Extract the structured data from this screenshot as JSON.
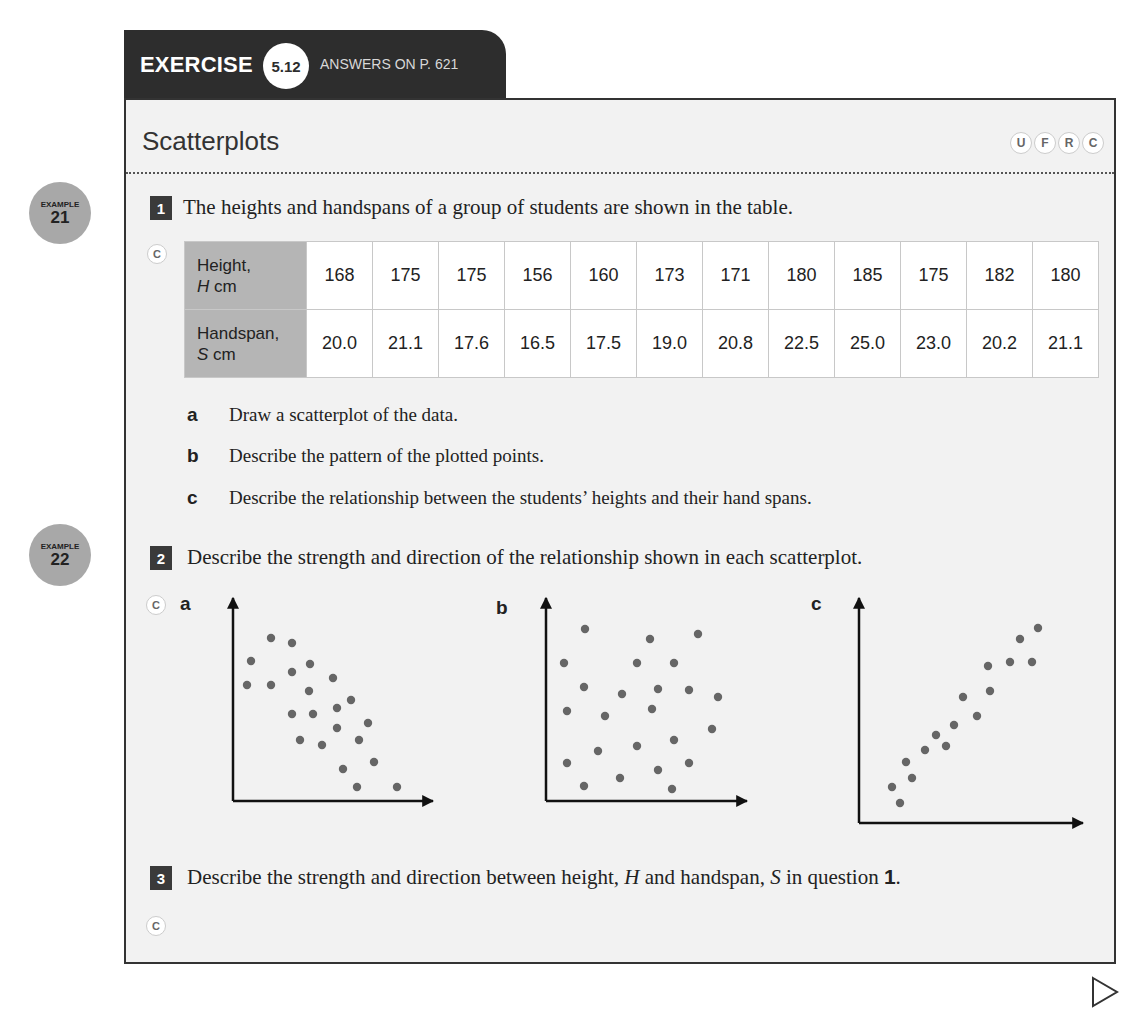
{
  "header": {
    "exercise_label": "EXERCISE",
    "exercise_number": "5.12",
    "answers_ref": "ANSWERS ON P. 621"
  },
  "section": {
    "title": "Scatterplots",
    "skill_badges": [
      "U",
      "F",
      "R",
      "C"
    ]
  },
  "examples": [
    {
      "label": "EXAMPLE",
      "number": "21"
    },
    {
      "label": "EXAMPLE",
      "number": "22"
    }
  ],
  "questions": [
    {
      "number": "1",
      "text": "The heights and handspans of a group of students are shown in the table.",
      "badge": "C",
      "table": {
        "rows": [
          {
            "header_line1": "Height,",
            "header_var": "H",
            "header_unit": " cm",
            "values": [
              "168",
              "175",
              "175",
              "156",
              "160",
              "173",
              "171",
              "180",
              "185",
              "175",
              "182",
              "180"
            ]
          },
          {
            "header_line1": "Handspan,",
            "header_var": "S",
            "header_unit": " cm",
            "values": [
              "20.0",
              "21.1",
              "17.6",
              "16.5",
              "17.5",
              "19.0",
              "20.8",
              "22.5",
              "25.0",
              "23.0",
              "20.2",
              "21.1"
            ]
          }
        ]
      },
      "parts": [
        {
          "letter": "a",
          "text": "Draw a scatterplot of the data."
        },
        {
          "letter": "b",
          "text": "Describe the pattern of the plotted points."
        },
        {
          "letter": "c",
          "text": "Describe the relationship between the students’ heights and their hand spans."
        }
      ]
    },
    {
      "number": "2",
      "text": "Describe the strength and direction of the relationship shown in each scatterplot.",
      "badge": "C",
      "plot_labels": [
        "a",
        "b",
        "c"
      ]
    },
    {
      "number": "3",
      "text_before": "Describe the strength and direction between height, ",
      "var_h": "H",
      "text_mid": " and handspan, ",
      "var_s": "S",
      "text_after": " in question ",
      "ref": "1",
      "period": ".",
      "badge": "C"
    }
  ],
  "chart_data": [
    {
      "type": "scatter",
      "title": "a",
      "xlabel": "",
      "ylabel": "",
      "grid": false,
      "points_px": [
        [
          271,
          638
        ],
        [
          292,
          643
        ],
        [
          251,
          661
        ],
        [
          310,
          664
        ],
        [
          292,
          672
        ],
        [
          333,
          678
        ],
        [
          247,
          685
        ],
        [
          271,
          685
        ],
        [
          309,
          691
        ],
        [
          351,
          700
        ],
        [
          337,
          708
        ],
        [
          292,
          714
        ],
        [
          313,
          714
        ],
        [
          368,
          723
        ],
        [
          337,
          728
        ],
        [
          300,
          740
        ],
        [
          359,
          740
        ],
        [
          322,
          745
        ],
        [
          374,
          762
        ],
        [
          343,
          769
        ],
        [
          357,
          787
        ],
        [
          397,
          787
        ]
      ]
    },
    {
      "type": "scatter",
      "title": "b",
      "xlabel": "",
      "ylabel": "",
      "grid": false,
      "points_px": [
        [
          585,
          629
        ],
        [
          650,
          639
        ],
        [
          698,
          634
        ],
        [
          564,
          663
        ],
        [
          637,
          663
        ],
        [
          674,
          663
        ],
        [
          584,
          687
        ],
        [
          622,
          694
        ],
        [
          658,
          689
        ],
        [
          689,
          690
        ],
        [
          718,
          697
        ],
        [
          567,
          711
        ],
        [
          605,
          716
        ],
        [
          652,
          709
        ],
        [
          712,
          729
        ],
        [
          674,
          740
        ],
        [
          637,
          746
        ],
        [
          598,
          751
        ],
        [
          567,
          763
        ],
        [
          689,
          763
        ],
        [
          658,
          770
        ],
        [
          620,
          778
        ],
        [
          584,
          786
        ],
        [
          672,
          789
        ]
      ]
    },
    {
      "type": "scatter",
      "title": "c",
      "xlabel": "",
      "ylabel": "",
      "grid": false,
      "points_px": [
        [
          1038,
          628
        ],
        [
          1020,
          639
        ],
        [
          1010,
          662
        ],
        [
          1032,
          662
        ],
        [
          988,
          666
        ],
        [
          990,
          691
        ],
        [
          963,
          697
        ],
        [
          977,
          716
        ],
        [
          954,
          725
        ],
        [
          936,
          735
        ],
        [
          946,
          746
        ],
        [
          925,
          750
        ],
        [
          906,
          762
        ],
        [
          912,
          778
        ],
        [
          892,
          787
        ],
        [
          900,
          803
        ]
      ]
    }
  ],
  "navigation": {
    "next_icon": "triangle-right"
  }
}
